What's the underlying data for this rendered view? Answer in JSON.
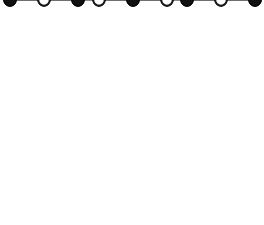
{
  "figure": {
    "canvas": {
      "width": 264,
      "height": 225
    },
    "line_color": "#8a8a8a",
    "diagonal_line_color": "#6f6f6f",
    "background_color": "#ffffff",
    "filled_atom_color": "#111111",
    "open_atom_fill": "#ffffff",
    "open_atom_stroke": "#1a1a1a",
    "atom_radius": 6.2,
    "open_atom_radius": 5.6
  },
  "projection": {
    "origin_x": 10,
    "origin_y": 216,
    "step_x": 88.5,
    "step_y": 88,
    "depth_dx": 34,
    "depth_dy": -16,
    "columns": 3,
    "rows": 3,
    "layers": 3
  },
  "lattice": {
    "type": "rock-salt",
    "nodes_per_edge": 3,
    "total_nodes": 27,
    "filled_count": 14,
    "open_count": 13,
    "layers": [
      {
        "name": "top-layer",
        "rows": [
          {
            "name": "top-front-row",
            "y": 40,
            "nodes": [
              {
                "x": 10,
                "type": "filled"
              },
              {
                "x": 99,
                "type": "open"
              },
              {
                "x": 187,
                "type": "filled"
              }
            ]
          },
          {
            "name": "top-middle-row",
            "y": 24,
            "nodes": [
              {
                "x": 44,
                "type": "open"
              },
              {
                "x": 133,
                "type": "filled"
              },
              {
                "x": 221,
                "type": "open"
              }
            ]
          },
          {
            "name": "top-back-row",
            "y": 8,
            "nodes": [
              {
                "x": 78,
                "type": "filled"
              },
              {
                "x": 167,
                "type": "open"
              },
              {
                "x": 255,
                "type": "filled"
              }
            ]
          }
        ]
      },
      {
        "name": "middle-layer",
        "rows": [
          {
            "name": "middle-front-row",
            "y": 128,
            "nodes": [
              {
                "x": 10,
                "type": "open"
              },
              {
                "x": 99,
                "type": "filled"
              },
              {
                "x": 187,
                "type": "open"
              }
            ]
          },
          {
            "name": "middle-middle-row",
            "y": 112,
            "nodes": [
              {
                "x": 44,
                "type": "filled"
              },
              {
                "x": 133,
                "type": "open"
              },
              {
                "x": 221,
                "type": "filled"
              }
            ]
          },
          {
            "name": "middle-back-row",
            "y": 96,
            "nodes": [
              {
                "x": 78,
                "type": "open"
              },
              {
                "x": 167,
                "type": "filled"
              },
              {
                "x": 255,
                "type": "open"
              }
            ]
          }
        ]
      },
      {
        "name": "bottom-layer",
        "rows": [
          {
            "name": "bottom-front-row",
            "y": 216,
            "nodes": [
              {
                "x": 10,
                "type": "filled"
              },
              {
                "x": 99,
                "type": "open"
              },
              {
                "x": 187,
                "type": "filled"
              }
            ]
          },
          {
            "name": "bottom-middle-row",
            "y": 200,
            "nodes": [
              {
                "x": 44,
                "type": "open"
              },
              {
                "x": 133,
                "type": "filled"
              },
              {
                "x": 221,
                "type": "open"
              }
            ]
          },
          {
            "name": "bottom-back-row",
            "y": 184,
            "nodes": [
              {
                "x": 78,
                "type": "filled"
              },
              {
                "x": 167,
                "type": "open"
              },
              {
                "x": 255,
                "type": "filled"
              }
            ]
          }
        ]
      }
    ]
  }
}
